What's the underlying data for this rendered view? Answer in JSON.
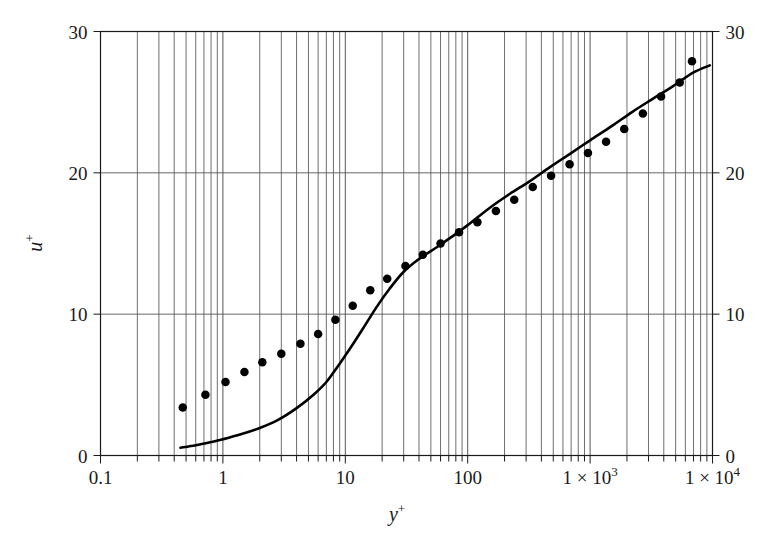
{
  "chart_data": {
    "type": "line",
    "title": "",
    "xlabel": "y+",
    "ylabel": "u+",
    "xscale": "log",
    "yscale": "linear",
    "xlim": [
      0.1,
      10000
    ],
    "ylim": [
      0,
      30
    ],
    "grid": true,
    "grid_minor_x": true,
    "legend": "none",
    "x_tick_labels": [
      "0.1",
      "1",
      "10",
      "100",
      "1 × 10",
      "1 × 10"
    ],
    "x_tick_values": [
      0.1,
      1,
      10,
      100,
      1000,
      10000
    ],
    "x_tick_exponents": [
      "",
      "",
      "",
      "",
      "3",
      "4"
    ],
    "y_tick_labels": [
      "0",
      "10",
      "20",
      "30"
    ],
    "y_tick_values": [
      0,
      10,
      20,
      30
    ],
    "y_tick_labels_right": [
      "0",
      "10",
      "20",
      "30"
    ],
    "series": [
      {
        "name": "model-curve",
        "type": "line",
        "color": "#000000",
        "linewidth": 2.6,
        "x": [
          0.45,
          0.6,
          0.8,
          1.0,
          1.4,
          2.0,
          2.8,
          4.0,
          5.5,
          7.0,
          9.0,
          11.0,
          14.0,
          18.0,
          23.0,
          30.0,
          40.0,
          55.0,
          75.0,
          100.0,
          150.0,
          220.0,
          320.0,
          470.0,
          700.0,
          1000.0,
          1500.0,
          2200.0,
          3200.0,
          4700.0,
          7000.0,
          9500.0
        ],
        "y": [
          0.55,
          0.72,
          0.95,
          1.15,
          1.5,
          1.95,
          2.5,
          3.35,
          4.3,
          5.2,
          6.5,
          7.6,
          9.0,
          10.5,
          11.8,
          13.0,
          13.9,
          14.7,
          15.5,
          16.3,
          17.5,
          18.5,
          19.4,
          20.4,
          21.4,
          22.3,
          23.3,
          24.3,
          25.2,
          26.1,
          27.1,
          27.6
        ]
      },
      {
        "name": "experimental-data",
        "type": "scatter",
        "color": "#000000",
        "marker": "filled-circle",
        "marker_size": 8.5,
        "x": [
          0.47,
          0.72,
          1.05,
          1.5,
          2.1,
          3.0,
          4.3,
          6.0,
          8.3,
          11.5,
          16.0,
          22.0,
          31.0,
          43.0,
          60.0,
          85.0,
          120.0,
          170.0,
          240.0,
          340.0,
          480.0,
          680.0,
          960.0,
          1350.0,
          1900.0,
          2700.0,
          3800.0,
          5400.0,
          6800.0
        ],
        "y": [
          3.4,
          4.3,
          5.2,
          5.9,
          6.6,
          7.2,
          7.9,
          8.6,
          9.6,
          10.6,
          11.7,
          12.5,
          13.4,
          14.2,
          15.0,
          15.8,
          16.5,
          17.3,
          18.1,
          19.0,
          19.8,
          20.6,
          21.4,
          22.2,
          23.1,
          24.2,
          25.4,
          26.4,
          27.9
        ]
      }
    ]
  },
  "axes": {
    "left_ticks": [
      "0",
      "10",
      "20",
      "30"
    ],
    "right_ticks": [
      "0",
      "10",
      "20",
      "30"
    ],
    "bottom_ticks": [
      "0.1",
      "1",
      "10",
      "100",
      "1 × 10³",
      "1 × 10⁴"
    ]
  },
  "colors": {
    "line": "#000000",
    "marker": "#000000",
    "grid": "#555555",
    "axis": "#1a1a1a",
    "background": "#ffffff"
  }
}
